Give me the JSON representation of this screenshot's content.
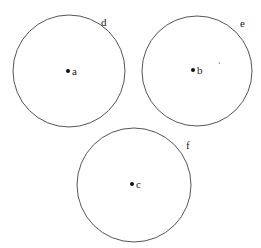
{
  "diagram": {
    "circles": [
      {
        "id": "d",
        "label": "d",
        "center_label": "a",
        "cx": 69,
        "cy": 71,
        "r": 56,
        "label_x": 101,
        "label_y": 26,
        "dot_x": 68,
        "dot_y": 71
      },
      {
        "id": "e",
        "label": "e",
        "center_label": "b",
        "cx": 197,
        "cy": 71,
        "r": 55,
        "label_x": 240,
        "label_y": 27,
        "dot_x": 193,
        "dot_y": 70
      },
      {
        "id": "f",
        "label": "f",
        "center_label": "c",
        "cx": 134,
        "cy": 185,
        "r": 57,
        "label_x": 186,
        "label_y": 149,
        "dot_x": 132,
        "dot_y": 184
      }
    ],
    "stroke_color": "#555555",
    "dot_color": "#111111"
  }
}
